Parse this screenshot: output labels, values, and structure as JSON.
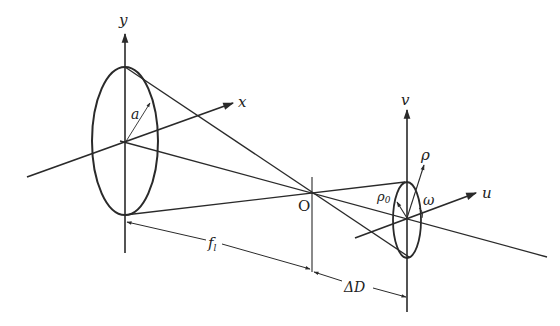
{
  "diagram": {
    "type": "optics-geometry",
    "colors": {
      "ink": "#2a2a2a",
      "background": "#ffffff"
    },
    "labels": {
      "y_axis": "y",
      "x_axis": "x",
      "radius": "a",
      "focal_point": "O",
      "focal_length": "f",
      "focal_length_sub": "l",
      "defocus": "ΔD",
      "v_axis": "v",
      "u_axis": "u",
      "rho": "ρ",
      "rho0": "ρ",
      "rho0_sub": "0",
      "omega": "ω"
    },
    "aperture_plane": {
      "center": [
        125,
        143
      ],
      "semi_axes": [
        33,
        75
      ]
    },
    "focal_point": [
      312,
      194
    ],
    "observation_plane": {
      "center": [
        407,
        219
      ],
      "semi_axes": [
        14,
        38
      ]
    }
  }
}
